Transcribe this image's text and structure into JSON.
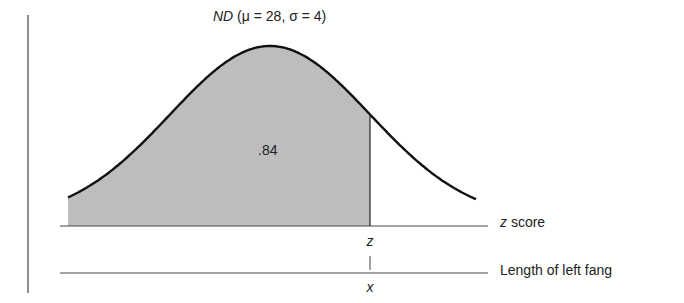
{
  "chart_data": {
    "type": "area",
    "title": "ND (μ = 28, σ = 4)",
    "title_parts": {
      "dist": "ND",
      "params": " (μ = 28, σ = 4)"
    },
    "distribution": "normal",
    "mean": 28,
    "sd": 4,
    "shaded_region": "left of z",
    "shaded_area": ".84",
    "z_value_approx": 1.0,
    "axes": [
      {
        "label": "z score",
        "marker": "z"
      },
      {
        "label": "Length of left fang",
        "marker": "x"
      }
    ],
    "grid": false,
    "colors": {
      "shade": "#bdbdbd",
      "curve": "#111111",
      "axis": "#444444"
    }
  }
}
